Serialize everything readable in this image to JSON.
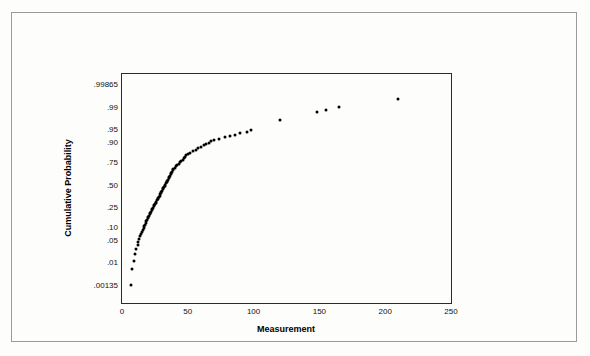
{
  "chart_data": {
    "type": "scatter",
    "title": "",
    "xlabel": "Measurement",
    "ylabel": "Cumulative Probability",
    "xlim": [
      0,
      250
    ],
    "xticks": [
      0,
      50,
      100,
      150,
      200,
      250
    ],
    "ytick_labels": [
      ".00135",
      ".01",
      ".05",
      ".10",
      ".25",
      ".50",
      ".75",
      ".90",
      ".95",
      ".99",
      ".99865"
    ],
    "ytick_probs": [
      0.00135,
      0.01,
      0.05,
      0.1,
      0.25,
      0.5,
      0.75,
      0.9,
      0.95,
      0.99,
      0.99865
    ],
    "grid": false,
    "legend": null,
    "y_scale": "normal-probability",
    "points": [
      [
        6.5,
        0.00135
      ],
      [
        7.5,
        0.006
      ],
      [
        9.0,
        0.011
      ],
      [
        10.0,
        0.019
      ],
      [
        11.0,
        0.027
      ],
      [
        12.0,
        0.035
      ],
      [
        12.5,
        0.044
      ],
      [
        13.0,
        0.052
      ],
      [
        14.0,
        0.061
      ],
      [
        14.5,
        0.07
      ],
      [
        15.0,
        0.079
      ],
      [
        16.0,
        0.088
      ],
      [
        16.5,
        0.097
      ],
      [
        17.0,
        0.107
      ],
      [
        17.5,
        0.116
      ],
      [
        18.0,
        0.126
      ],
      [
        18.5,
        0.136
      ],
      [
        19.0,
        0.146
      ],
      [
        19.5,
        0.156
      ],
      [
        20.0,
        0.166
      ],
      [
        20.5,
        0.177
      ],
      [
        21.0,
        0.188
      ],
      [
        21.5,
        0.199
      ],
      [
        22.0,
        0.21
      ],
      [
        22.5,
        0.221
      ],
      [
        23.0,
        0.232
      ],
      [
        23.5,
        0.244
      ],
      [
        24.0,
        0.256
      ],
      [
        24.5,
        0.268
      ],
      [
        25.0,
        0.28
      ],
      [
        25.5,
        0.293
      ],
      [
        26.0,
        0.305
      ],
      [
        26.5,
        0.318
      ],
      [
        27.0,
        0.331
      ],
      [
        27.5,
        0.344
      ],
      [
        28.0,
        0.357
      ],
      [
        28.5,
        0.371
      ],
      [
        29.0,
        0.384
      ],
      [
        29.5,
        0.398
      ],
      [
        30.0,
        0.412
      ],
      [
        30.5,
        0.426
      ],
      [
        31.0,
        0.441
      ],
      [
        31.5,
        0.455
      ],
      [
        32.0,
        0.47
      ],
      [
        32.5,
        0.484
      ],
      [
        33.0,
        0.499
      ],
      [
        33.5,
        0.514
      ],
      [
        34.0,
        0.529
      ],
      [
        34.5,
        0.544
      ],
      [
        35.0,
        0.559
      ],
      [
        35.5,
        0.574
      ],
      [
        36.0,
        0.589
      ],
      [
        36.5,
        0.604
      ],
      [
        37.0,
        0.619
      ],
      [
        37.5,
        0.634
      ],
      [
        38.0,
        0.649
      ],
      [
        38.5,
        0.663
      ],
      [
        39.0,
        0.678
      ],
      [
        40.0,
        0.692
      ],
      [
        41.0,
        0.706
      ],
      [
        42.0,
        0.72
      ],
      [
        43.0,
        0.733
      ],
      [
        44.0,
        0.747
      ],
      [
        45.0,
        0.76
      ],
      [
        46.0,
        0.772
      ],
      [
        47.0,
        0.785
      ],
      [
        48.0,
        0.797
      ],
      [
        49.0,
        0.808
      ],
      [
        50.0,
        0.82
      ],
      [
        52.0,
        0.83
      ],
      [
        54.0,
        0.841
      ],
      [
        56.0,
        0.851
      ],
      [
        58.0,
        0.86
      ],
      [
        60.0,
        0.869
      ],
      [
        62.0,
        0.878
      ],
      [
        64.0,
        0.886
      ],
      [
        66.0,
        0.893
      ],
      [
        68.0,
        0.901
      ],
      [
        70.0,
        0.908
      ],
      [
        74.0,
        0.914
      ],
      [
        78.0,
        0.92
      ],
      [
        82.0,
        0.926
      ],
      [
        86.0,
        0.932
      ],
      [
        90.0,
        0.937
      ],
      [
        95.0,
        0.942
      ],
      [
        98.0,
        0.947
      ],
      [
        120.0,
        0.972
      ],
      [
        148.0,
        0.985
      ],
      [
        155.0,
        0.987
      ],
      [
        165.0,
        0.99
      ],
      [
        210.0,
        0.9945
      ]
    ]
  }
}
